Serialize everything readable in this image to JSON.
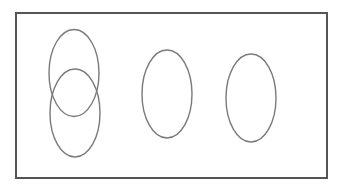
{
  "diagram": {
    "type": "venn-diagram",
    "canvas": {
      "width": 348,
      "height": 187,
      "background": "#ffffff"
    },
    "universal_set": {
      "shape": "rectangle",
      "x": 16,
      "y": 13,
      "width": 311,
      "height": 165,
      "stroke": "#555555",
      "stroke_width": 2
    },
    "sets": [
      {
        "id": "set-1",
        "shape": "ellipse",
        "cx": 74,
        "cy": 73,
        "rx": 25,
        "ry": 43.5,
        "stroke": "#7a7a7a",
        "stroke_width": 1.4
      },
      {
        "id": "set-2",
        "shape": "ellipse",
        "cx": 75,
        "cy": 113,
        "rx": 25,
        "ry": 44,
        "stroke": "#7a7a7a",
        "stroke_width": 1.4
      },
      {
        "id": "set-3",
        "shape": "ellipse",
        "cx": 167,
        "cy": 94,
        "rx": 25,
        "ry": 44,
        "stroke": "#7a7a7a",
        "stroke_width": 1.4
      },
      {
        "id": "set-4",
        "shape": "ellipse",
        "cx": 251,
        "cy": 98,
        "rx": 25,
        "ry": 44,
        "stroke": "#7a7a7a",
        "stroke_width": 1.4
      }
    ],
    "relationships": {
      "overlapping": [
        [
          "set-1",
          "set-2"
        ]
      ],
      "disjoint": [
        "set-3",
        "set-4"
      ]
    }
  }
}
